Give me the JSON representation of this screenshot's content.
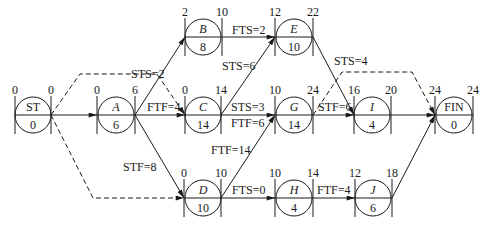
{
  "diagram": {
    "type": "precedence-network",
    "nodes": [
      {
        "id": "ST",
        "label": "ST",
        "italic": false,
        "es": "0",
        "ef": "0",
        "dur": "0",
        "cx": 33,
        "cy": 115
      },
      {
        "id": "A",
        "label": "A",
        "italic": true,
        "es": "0",
        "ef": "6",
        "dur": "6",
        "cx": 116,
        "cy": 115
      },
      {
        "id": "B",
        "label": "B",
        "italic": true,
        "es": "2",
        "ef": "10",
        "dur": "8",
        "cx": 203,
        "cy": 37
      },
      {
        "id": "C",
        "label": "C",
        "italic": true,
        "es": "0",
        "ef": "14",
        "dur": "14",
        "cx": 203,
        "cy": 115
      },
      {
        "id": "D",
        "label": "D",
        "italic": true,
        "es": "0",
        "ef": "10",
        "dur": "10",
        "cx": 203,
        "cy": 198
      },
      {
        "id": "E",
        "label": "E",
        "italic": true,
        "es": "12",
        "ef": "22",
        "dur": "10",
        "cx": 294,
        "cy": 37
      },
      {
        "id": "G",
        "label": "G",
        "italic": true,
        "es": "10",
        "ef": "24",
        "dur": "14",
        "cx": 294,
        "cy": 115
      },
      {
        "id": "H",
        "label": "H",
        "italic": true,
        "es": "10",
        "ef": "14",
        "dur": "4",
        "cx": 294,
        "cy": 198
      },
      {
        "id": "I",
        "label": "I",
        "italic": true,
        "es": "16",
        "ef": "20",
        "dur": "4",
        "cx": 372,
        "cy": 115
      },
      {
        "id": "J",
        "label": "J",
        "italic": true,
        "es": "12",
        "ef": "18",
        "dur": "6",
        "cx": 373,
        "cy": 198
      },
      {
        "id": "FIN",
        "label": "FIN",
        "italic": false,
        "es": "24",
        "ef": "24",
        "dur": "0",
        "cx": 454,
        "cy": 115
      }
    ],
    "links": [
      {
        "from": "ST",
        "to": "A",
        "label": "",
        "dashed": false
      },
      {
        "from": "ST",
        "to": "C",
        "label": "",
        "dashed": true
      },
      {
        "from": "ST",
        "to": "D",
        "label": "",
        "dashed": true
      },
      {
        "from": "A",
        "to": "B",
        "label": "STS=2",
        "dashed": false
      },
      {
        "from": "A",
        "to": "C",
        "label": "FTF=4",
        "dashed": false
      },
      {
        "from": "A",
        "to": "D",
        "label": "STF=8",
        "dashed": false
      },
      {
        "from": "B",
        "to": "E",
        "label": "FTS=2",
        "dashed": false
      },
      {
        "from": "C",
        "to": "E",
        "label": "STS=6",
        "dashed": false
      },
      {
        "from": "C",
        "to": "G",
        "label": "STS=3",
        "dashed": false
      },
      {
        "from": "C",
        "to": "G",
        "label": "FTF=6",
        "dashed": false
      },
      {
        "from": "D",
        "to": "G",
        "label": "FTF=14",
        "dashed": false
      },
      {
        "from": "D",
        "to": "H",
        "label": "FTS=0",
        "dashed": false
      },
      {
        "from": "E",
        "to": "I",
        "label": "STS=4",
        "dashed": false
      },
      {
        "from": "G",
        "to": "I",
        "label": "STF=6",
        "dashed": false
      },
      {
        "from": "G",
        "to": "FIN",
        "label": "",
        "dashed": true
      },
      {
        "from": "H",
        "to": "J",
        "label": "FTF=4",
        "dashed": false
      },
      {
        "from": "I",
        "to": "FIN",
        "label": "",
        "dashed": false
      },
      {
        "from": "J",
        "to": "FIN",
        "label": "",
        "dashed": false
      }
    ]
  },
  "text": {
    "ST": {
      "label": "ST",
      "es": "0",
      "ef": "0",
      "dur": "0"
    },
    "A": {
      "label": "A",
      "es": "0",
      "ef": "6",
      "dur": "6"
    },
    "B": {
      "label": "B",
      "es": "2",
      "ef": "10",
      "dur": "8"
    },
    "C": {
      "label": "C",
      "es": "0",
      "ef": "14",
      "dur": "14"
    },
    "D": {
      "label": "D",
      "es": "0",
      "ef": "10",
      "dur": "10"
    },
    "E": {
      "label": "E",
      "es": "12",
      "ef": "22",
      "dur": "10"
    },
    "G": {
      "label": "G",
      "es": "10",
      "ef": "24",
      "dur": "14"
    },
    "H": {
      "label": "H",
      "es": "10",
      "ef": "14",
      "dur": "4"
    },
    "I": {
      "label": "I",
      "es": "16",
      "ef": "20",
      "dur": "4"
    },
    "J": {
      "label": "J",
      "es": "12",
      "ef": "18",
      "dur": "6"
    },
    "FIN": {
      "label": "FIN",
      "es": "24",
      "ef": "24",
      "dur": "0"
    },
    "links": {
      "a_b": "STS=2",
      "a_c": "FTF=4",
      "a_d": "STF=8",
      "b_e": "FTS=2",
      "c_e": "STS=6",
      "c_g_sts": "STS=3",
      "c_g_ftf": "FTF=6",
      "d_g": "FTF=14",
      "d_h": "FTS=0",
      "e_i": "STS=4",
      "g_i": "STF=6",
      "h_j": "FTF=4"
    }
  }
}
